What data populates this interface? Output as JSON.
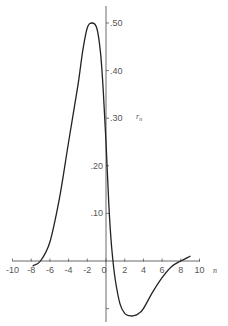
{
  "chart_data": {
    "type": "line",
    "title": "",
    "xlabel": "n",
    "ylabel": "r_n",
    "xlim": [
      -10,
      10
    ],
    "ylim": [
      -0.12,
      0.52
    ],
    "grid": false,
    "legend": null,
    "x_ticks": [
      -10,
      -8,
      -6,
      -4,
      -2,
      0,
      2,
      4,
      6,
      8,
      10
    ],
    "x_tick_labels": [
      "-10",
      "-8",
      "-6",
      "-4",
      "-2",
      "0",
      "2",
      "4",
      "6",
      "8",
      "10"
    ],
    "y_ticks": [
      -0.1,
      0.1,
      0.2,
      0.3,
      0.4,
      0.5
    ],
    "y_tick_labels": [
      "",
      ".10",
      ".20",
      ".30",
      ".40",
      ".50"
    ],
    "series": [
      {
        "name": "r_n",
        "x": [
          -7.8,
          -7.0,
          -6.0,
          -5.0,
          -4.0,
          -3.0,
          -2.5,
          -2.0,
          -1.5,
          -1.0,
          -0.6,
          -0.3,
          0.0,
          0.3,
          0.6,
          1.0,
          1.5,
          2.0,
          2.5,
          3.0,
          3.5,
          4.0,
          5.0,
          6.0,
          7.0,
          8.0,
          9.0
        ],
        "values": [
          -0.01,
          0.0,
          0.04,
          0.13,
          0.25,
          0.37,
          0.44,
          0.49,
          0.5,
          0.49,
          0.44,
          0.36,
          0.25,
          0.12,
          0.03,
          -0.04,
          -0.09,
          -0.11,
          -0.115,
          -0.115,
          -0.11,
          -0.1,
          -0.065,
          -0.035,
          -0.012,
          0.0,
          0.01
        ]
      }
    ]
  },
  "labels": {
    "x_axis_name": "n",
    "y_axis_name": "r",
    "y_axis_subscript": "n"
  }
}
